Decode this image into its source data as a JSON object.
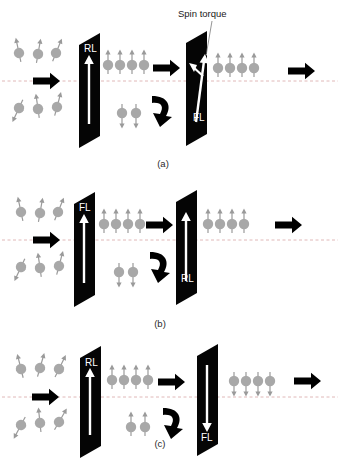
{
  "figure": {
    "background_color": "#ffffff",
    "width": 340,
    "height": 462,
    "annotation": {
      "spin_torque_label": "Spin torque"
    },
    "colors": {
      "layer_fill": "#050505",
      "layer_edge": "#000000",
      "magnetization_arrow": "#ffffff",
      "electron_sphere": "#a8a8a8",
      "electron_arrow": "#9a9a9a",
      "current_arrow": "#000000",
      "axis_dashed_line": "#e0b8b8",
      "text_dark": "#1a1a1a",
      "text_light": "#ffffff"
    },
    "panels": [
      {
        "id": "panel-a",
        "caption": "(a)",
        "left_layer": {
          "label": "RL",
          "magnetization": "up",
          "label_position": "top"
        },
        "right_layer": {
          "label": "FL",
          "magnetization": "tilted",
          "label_position": "bottom",
          "has_spin_torque": true
        },
        "incoming_spins": {
          "state": "unpolarized",
          "top_row_count": 3,
          "bottom_row_count": 3
        },
        "transmitted_spins": {
          "state": "polarized-up",
          "count": 4
        },
        "reflected_spins": {
          "state": "polarized-down",
          "count": 2
        },
        "outgoing_spins": {
          "state": "polarized-up",
          "count": 3
        },
        "current_arrows": 3
      },
      {
        "id": "panel-b",
        "caption": "(b)",
        "left_layer": {
          "label": "FL",
          "magnetization": "up",
          "label_position": "top"
        },
        "right_layer": {
          "label": "RL",
          "magnetization": "up",
          "label_position": "bottom",
          "has_spin_torque": false
        },
        "incoming_spins": {
          "state": "unpolarized",
          "top_row_count": 3,
          "bottom_row_count": 3
        },
        "transmitted_spins": {
          "state": "polarized-up",
          "count": 4
        },
        "reflected_spins": {
          "state": "polarized-down",
          "count": 2
        },
        "outgoing_spins": {
          "state": "polarized-up",
          "count": 4
        },
        "current_arrows": 3
      },
      {
        "id": "panel-c",
        "caption": "(c)",
        "left_layer": {
          "label": "RL",
          "magnetization": "up",
          "label_position": "top"
        },
        "right_layer": {
          "label": "FL",
          "magnetization": "down",
          "label_position": "bottom",
          "has_spin_torque": false
        },
        "incoming_spins": {
          "state": "unpolarized",
          "top_row_count": 3,
          "bottom_row_count": 3
        },
        "transmitted_spins": {
          "state": "polarized-up",
          "count": 4
        },
        "reflected_spins": {
          "state": "polarized-up",
          "count": 2
        },
        "outgoing_spins": {
          "state": "polarized-down",
          "count": 4
        },
        "current_arrows": 3
      }
    ]
  }
}
